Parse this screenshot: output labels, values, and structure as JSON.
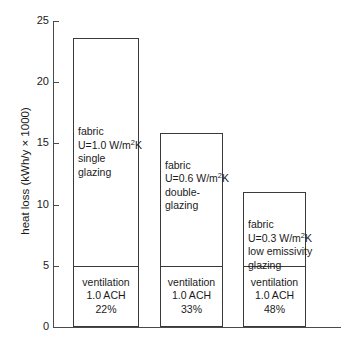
{
  "chart_data": {
    "type": "bar",
    "title": "",
    "xlabel": "",
    "ylabel": "heat loss (kWh/y × 1000)",
    "ylim": [
      0,
      25
    ],
    "yticks": [
      0,
      5,
      10,
      15,
      20,
      25
    ],
    "ytick_labels": [
      "0",
      "5",
      "10",
      "15",
      "20",
      "25"
    ],
    "grid": false,
    "legend": "none",
    "stacked": true,
    "categories": [
      "single glazing",
      "double-glazing",
      "low emissivity glazing"
    ],
    "series": [
      {
        "name": "ventilation",
        "values": [
          5.1,
          5.1,
          5.1
        ]
      },
      {
        "name": "fabric",
        "values": [
          18.5,
          10.75,
          5.9
        ]
      }
    ],
    "totals": [
      23.6,
      15.85,
      11.0
    ],
    "annotations": [
      "fabric U=1.0 W/m2K single glazing",
      "fabric U=0.6 W/m2K double-glazing",
      "fabric U=0.3 W/m2K low emissivity glazing",
      "ventilation 1.0 ACH 22%",
      "ventilation 1.0 ACH 33%",
      "ventilation 1.0 ACH 48%"
    ]
  },
  "axis": {
    "y_title": "heat loss (kWh/y × 1000)",
    "ticks": [
      {
        "value": 25,
        "label": "25"
      },
      {
        "value": 20,
        "label": "20"
      },
      {
        "value": 15,
        "label": "15"
      },
      {
        "value": 10,
        "label": "10"
      },
      {
        "value": 5,
        "label": "5"
      },
      {
        "value": 0,
        "label": "0"
      }
    ]
  },
  "bars": [
    {
      "id": "bar-single-glazing",
      "total": 23.6,
      "split": 5.1,
      "fabric": {
        "line1": "fabric",
        "line2_prefix": "U=1.0 W/m",
        "line2_sup": "2",
        "line2_suffix": "K",
        "line3": "single",
        "line4": "glazing"
      },
      "ventilation": {
        "line1": "ventilation",
        "line2": "1.0 ACH",
        "line3": "22%"
      }
    },
    {
      "id": "bar-double-glazing",
      "total": 15.85,
      "split": 5.1,
      "fabric": {
        "line1": "fabric",
        "line2_prefix": "U=0.6 W/m",
        "line2_sup": "2",
        "line2_suffix": "K",
        "line3": "double-",
        "line4": "glazing"
      },
      "ventilation": {
        "line1": "ventilation",
        "line2": "1.0 ACH",
        "line3": "33%"
      }
    },
    {
      "id": "bar-low-e-glazing",
      "total": 11.0,
      "split": 5.1,
      "fabric": {
        "line1": "fabric",
        "line2_prefix": "U=0.3 W/m",
        "line2_sup": "2",
        "line2_suffix": "K",
        "line3": "low emissivity",
        "line4": "glazing"
      },
      "ventilation": {
        "line1": "ventilation",
        "line2": "1.0 ACH",
        "line3": "48%"
      }
    }
  ],
  "colors": {
    "axis": "#4a4a4a",
    "bar_outline": "#3a3a3a",
    "text": "#1a1a1a",
    "background": "#ffffff"
  }
}
